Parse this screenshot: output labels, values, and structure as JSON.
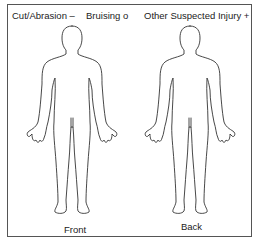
{
  "legend": {
    "cut": "Cut/Abrasion –",
    "bruising": "Bruising o",
    "other": "Other Suspected Injury +"
  },
  "figures": {
    "front": {
      "label": "Front",
      "icon": "body-outline-front"
    },
    "back": {
      "label": "Back",
      "icon": "body-outline-back"
    }
  },
  "colors": {
    "line": "#333333",
    "background": "#ffffff",
    "border": "#555555"
  }
}
